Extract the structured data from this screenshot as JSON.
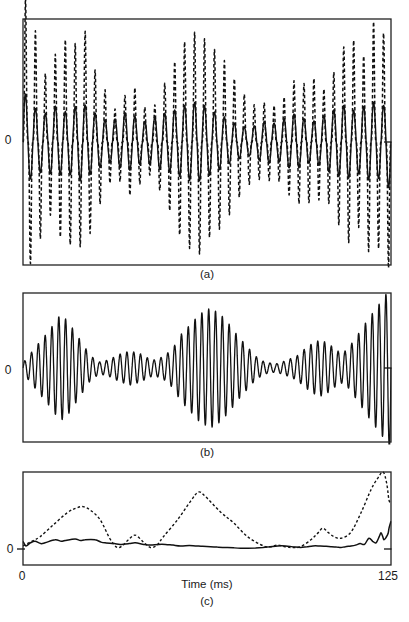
{
  "figure": {
    "background": "#ffffff",
    "line_color": "#111111",
    "frame_color": "#222222"
  },
  "chart_data": [
    {
      "panel": "a",
      "type": "line",
      "caption": "(a)",
      "y_zero_label": "0",
      "x_range_ms": [
        0,
        125
      ],
      "box": {
        "left": 23,
        "top": 19,
        "width": 368,
        "height": 246
      },
      "zero_y": 142,
      "zero_tick_right": true,
      "zero_tick_left": false,
      "series": [
        {
          "name": "broadband-waveform-dashed",
          "style": "dashed",
          "dash": "3.5 2.5",
          "width": 1.5,
          "waveshape": "spiky",
          "carrier_cycles": 37,
          "envelope_ms_px": [
            [
              0,
              135
            ],
            [
              1.4,
              150
            ],
            [
              3,
              110
            ],
            [
              5,
              112
            ],
            [
              8,
              62
            ],
            [
              11,
              88
            ],
            [
              15,
              105
            ],
            [
              18,
              98
            ],
            [
              21,
              112
            ],
            [
              24.5,
              72
            ],
            [
              27.6,
              54
            ],
            [
              31,
              32
            ],
            [
              34,
              44
            ],
            [
              37.5,
              58
            ],
            [
              40.5,
              36
            ],
            [
              44,
              32
            ],
            [
              47,
              52
            ],
            [
              50.4,
              72
            ],
            [
              53.5,
              95
            ],
            [
              57,
              108
            ],
            [
              60,
              112
            ],
            [
              63,
              96
            ],
            [
              65.4,
              92
            ],
            [
              68.8,
              80
            ],
            [
              72,
              62
            ],
            [
              75.6,
              46
            ],
            [
              79,
              36
            ],
            [
              82.4,
              40
            ],
            [
              85.8,
              36
            ],
            [
              89,
              46
            ],
            [
              92.6,
              64
            ],
            [
              95.7,
              58
            ],
            [
              99,
              64
            ],
            [
              102,
              52
            ],
            [
              105.6,
              70
            ],
            [
              108.6,
              94
            ],
            [
              112,
              105
            ],
            [
              115,
              76
            ],
            [
              118.5,
              125
            ],
            [
              121.6,
              100
            ],
            [
              125,
              135
            ]
          ]
        },
        {
          "name": "filtered-waveform-solid",
          "style": "solid",
          "width": 1.4,
          "waveshape": "sine",
          "carrier_cycles": 37,
          "envelope_ms_px": [
            [
              0,
              55
            ],
            [
              2,
              38
            ],
            [
              5,
              32
            ],
            [
              8,
              28
            ],
            [
              11,
              36
            ],
            [
              14,
              30
            ],
            [
              17,
              34
            ],
            [
              20,
              40
            ],
            [
              23,
              32
            ],
            [
              26,
              26
            ],
            [
              29,
              20
            ],
            [
              32,
              24
            ],
            [
              35,
              30
            ],
            [
              38,
              26
            ],
            [
              41,
              20
            ],
            [
              44,
              24
            ],
            [
              47,
              28
            ],
            [
              50,
              30
            ],
            [
              53,
              34
            ],
            [
              56,
              38
            ],
            [
              59,
              40
            ],
            [
              62,
              36
            ],
            [
              65,
              30
            ],
            [
              68,
              26
            ],
            [
              71,
              20
            ],
            [
              74,
              16
            ],
            [
              77,
              14
            ],
            [
              80,
              18
            ],
            [
              83,
              22
            ],
            [
              86,
              18
            ],
            [
              89,
              24
            ],
            [
              92,
              28
            ],
            [
              95,
              24
            ],
            [
              98,
              20
            ],
            [
              101,
              24
            ],
            [
              104,
              30
            ],
            [
              107,
              34
            ],
            [
              110,
              38
            ],
            [
              113,
              30
            ],
            [
              116,
              36
            ],
            [
              119,
              40
            ],
            [
              122,
              34
            ],
            [
              125,
              50
            ]
          ]
        }
      ]
    },
    {
      "panel": "b",
      "type": "line",
      "caption": "(b)",
      "y_zero_label": "0",
      "x_range_ms": [
        0,
        125
      ],
      "box": {
        "left": 23,
        "top": 293,
        "width": 368,
        "height": 149
      },
      "zero_y": 368,
      "zero_tick_right": true,
      "zero_tick_left": false,
      "series": [
        {
          "name": "amplitude-modulated-waveform",
          "style": "solid",
          "width": 1.3,
          "waveshape": "sine",
          "carrier_cycles": 54,
          "envelope_ms_px": [
            [
              0,
              5
            ],
            [
              4,
              20
            ],
            [
              9,
              38
            ],
            [
              12.6,
              53
            ],
            [
              15,
              48
            ],
            [
              19,
              30
            ],
            [
              23,
              12
            ],
            [
              26,
              6
            ],
            [
              29,
              8
            ],
            [
              33,
              14
            ],
            [
              36.4,
              17
            ],
            [
              40,
              14
            ],
            [
              43,
              9
            ],
            [
              45,
              8
            ],
            [
              48,
              12
            ],
            [
              51,
              20
            ],
            [
              53.5,
              33
            ],
            [
              57,
              44
            ],
            [
              60,
              54
            ],
            [
              63.7,
              60
            ],
            [
              67,
              54
            ],
            [
              70,
              44
            ],
            [
              73,
              32
            ],
            [
              76,
              22
            ],
            [
              79,
              12
            ],
            [
              82,
              6
            ],
            [
              85.8,
              4
            ],
            [
              89,
              7
            ],
            [
              93,
              12
            ],
            [
              96,
              20
            ],
            [
              99,
              26
            ],
            [
              101.2,
              28
            ],
            [
              104,
              24
            ],
            [
              106,
              19
            ],
            [
              108,
              15
            ],
            [
              110,
              18
            ],
            [
              112,
              26
            ],
            [
              114.8,
              38
            ],
            [
              117,
              48
            ],
            [
              119,
              56
            ],
            [
              121,
              64
            ],
            [
              123,
              72
            ],
            [
              125,
              84
            ]
          ]
        }
      ]
    },
    {
      "panel": "c",
      "type": "line",
      "caption": "(c)",
      "y_zero_label": "0",
      "xlabel": "Time (ms)",
      "x_ticks": [
        {
          "ms": 0,
          "label": "0"
        },
        {
          "ms": 125,
          "label": "125"
        }
      ],
      "x_range_ms": [
        0,
        125
      ],
      "box": {
        "left": 23,
        "top": 472,
        "width": 368,
        "height": 93
      },
      "zero_y": 549,
      "zero_tick_right": true,
      "zero_tick_left": true,
      "amp_scale_px": 77,
      "series": [
        {
          "name": "envelope-dashed",
          "style": "dashed",
          "dash": "2.6 2.2",
          "width": 1.4,
          "points_ms_amp": [
            [
              0,
              0.04
            ],
            [
              3,
              0.1
            ],
            [
              5.8,
              0.16
            ],
            [
              10.2,
              0.31
            ],
            [
              15,
              0.47
            ],
            [
              18,
              0.53
            ],
            [
              20.4,
              0.55
            ],
            [
              23,
              0.5
            ],
            [
              26.2,
              0.38
            ],
            [
              29.6,
              0.13
            ],
            [
              32,
              0.02
            ],
            [
              34,
              0.05
            ],
            [
              35.8,
              0.12
            ],
            [
              38.1,
              0.18
            ],
            [
              40.9,
              0.09
            ],
            [
              43.3,
              0.02
            ],
            [
              45.5,
              0.05
            ],
            [
              47.7,
              0.16
            ],
            [
              52.5,
              0.38
            ],
            [
              56.9,
              0.62
            ],
            [
              59.6,
              0.74
            ],
            [
              62,
              0.68
            ],
            [
              67.1,
              0.48
            ],
            [
              71.5,
              0.34
            ],
            [
              76.3,
              0.16
            ],
            [
              81.7,
              0.04
            ],
            [
              84,
              0.03
            ],
            [
              86.5,
              0.05
            ],
            [
              89,
              0.03
            ],
            [
              91.5,
              0.02
            ],
            [
              94.3,
              0.03
            ],
            [
              97.8,
              0.12
            ],
            [
              100,
              0.2
            ],
            [
              101.8,
              0.27
            ],
            [
              103.5,
              0.22
            ],
            [
              105.6,
              0.16
            ],
            [
              108,
              0.14
            ],
            [
              111.4,
              0.22
            ],
            [
              114.8,
              0.47
            ],
            [
              118.2,
              0.77
            ],
            [
              120.5,
              0.92
            ],
            [
              122.3,
              1.0
            ],
            [
              123.5,
              0.86
            ],
            [
              124.3,
              0.64
            ],
            [
              125,
              0.58
            ]
          ]
        },
        {
          "name": "envelope-solid",
          "style": "solid",
          "width": 1.5,
          "points_ms_amp": [
            [
              0,
              0.1
            ],
            [
              1,
              0.04
            ],
            [
              2.5,
              0.08
            ],
            [
              4.1,
              0.1
            ],
            [
              6,
              0.07
            ],
            [
              7.5,
              0.08
            ],
            [
              10.9,
              0.12
            ],
            [
              13,
              0.1
            ],
            [
              14.3,
              0.11
            ],
            [
              17.7,
              0.13
            ],
            [
              19.5,
              0.11
            ],
            [
              21.1,
              0.12
            ],
            [
              24.5,
              0.12
            ],
            [
              26.5,
              0.09
            ],
            [
              27.9,
              0.08
            ],
            [
              31,
              0.07
            ],
            [
              33,
              0.06
            ],
            [
              36,
              0.07
            ],
            [
              38.1,
              0.08
            ],
            [
              41,
              0.06
            ],
            [
              43.3,
              0.05
            ],
            [
              46,
              0.06
            ],
            [
              48.4,
              0.06
            ],
            [
              51,
              0.05
            ],
            [
              53.5,
              0.04
            ],
            [
              56.5,
              0.045
            ],
            [
              58.6,
              0.04
            ],
            [
              61,
              0.035
            ],
            [
              63.7,
              0.03
            ],
            [
              66,
              0.025
            ],
            [
              68.8,
              0.02
            ],
            [
              71.5,
              0.015
            ],
            [
              73.9,
              0.01
            ],
            [
              76.5,
              0.01
            ],
            [
              79,
              0.012
            ],
            [
              81.5,
              0.02
            ],
            [
              84.1,
              0.03
            ],
            [
              86.5,
              0.04
            ],
            [
              89.2,
              0.04
            ],
            [
              91.5,
              0.03
            ],
            [
              94.3,
              0.02
            ],
            [
              96.5,
              0.03
            ],
            [
              98.5,
              0.04
            ],
            [
              101,
              0.04
            ],
            [
              103,
              0.035
            ],
            [
              104.6,
              0.03
            ],
            [
              106.5,
              0.025
            ],
            [
              108,
              0.02
            ],
            [
              109.5,
              0.03
            ],
            [
              111.4,
              0.04
            ],
            [
              113,
              0.05
            ],
            [
              114.5,
              0.07
            ],
            [
              116,
              0.06
            ],
            [
              117.5,
              0.14
            ],
            [
              118.8,
              0.1
            ],
            [
              119.9,
              0.08
            ],
            [
              121,
              0.16
            ],
            [
              121.6,
              0.21
            ],
            [
              122.2,
              0.16
            ],
            [
              122.6,
              0.12
            ],
            [
              123.3,
              0.15
            ],
            [
              124,
              0.2
            ],
            [
              124.4,
              0.28
            ],
            [
              125,
              0.36
            ]
          ]
        }
      ]
    }
  ]
}
